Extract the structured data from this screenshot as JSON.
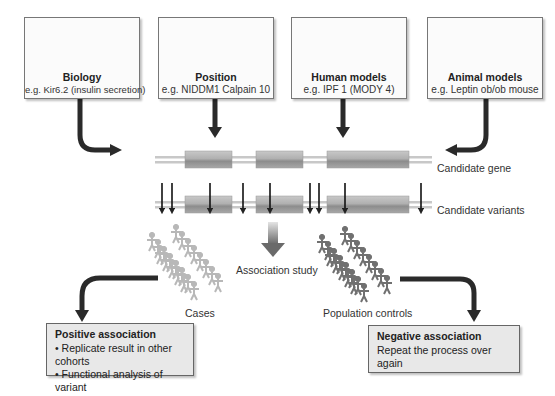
{
  "sources": [
    {
      "title": "Biology",
      "example": "e.g. Kir6.2 (insulin secretion)",
      "icon": "cell-icon"
    },
    {
      "title": "Position",
      "example": "e.g. NIDDM1 Calpain 10",
      "icon": "linkage-plot-icon"
    },
    {
      "title": "Human models",
      "example": "e.g. IPF 1 (MODY 4)",
      "icon": "pedigree-icon"
    },
    {
      "title": "Animal models",
      "example": "e.g. Leptin ob/ob mouse",
      "icon": "mouse-icon"
    }
  ],
  "gene": {
    "candidate_gene_label": "Candidate gene",
    "candidate_variants_label": "Candidate variants"
  },
  "study": {
    "association_label": "Association study",
    "cases_label": "Cases",
    "controls_label": "Population controls",
    "colors": {
      "cases": "#b8b8b8",
      "controls": "#707070"
    }
  },
  "results": {
    "positive": {
      "title": "Positive association",
      "items": [
        "• Replicate result in other cohorts",
        "• Functional analysis of variant"
      ]
    },
    "negative": {
      "title": "Negative association",
      "items": [
        "Repeat the process over again"
      ]
    }
  }
}
